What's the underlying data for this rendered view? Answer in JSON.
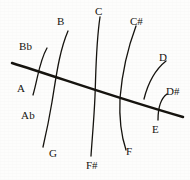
{
  "diagram": {
    "type": "hand-drawn-lattice",
    "background_color": "#fdfdfc",
    "ink_color": "#16140f",
    "axis": {
      "name": "main-diagonal-line",
      "start": [
        12,
        63
      ],
      "end": [
        183,
        117
      ],
      "stroke_width": 2.4
    },
    "arcs": [
      {
        "id": "arc-a-bb",
        "top_label": "Bb",
        "bottom_label": "Ab",
        "mid_label": "A",
        "path": "M 47 48 C 39 62, 38 78, 33 95",
        "stroke_width": 1.3
      },
      {
        "id": "arc-b-g",
        "top_label": "B",
        "bottom_label": "G",
        "path": "M 68 31 C 59 52, 56 78, 52 102 C 49 120, 46 134, 43 147",
        "stroke_width": 1.3
      },
      {
        "id": "arc-c-fsharp",
        "top_label": "C",
        "bottom_label": "F#",
        "path": "M 100 17 C 96 44, 96 70, 95 96 C 94 120, 92 140, 91 156",
        "stroke_width": 1.3
      },
      {
        "id": "arc-csharp-f",
        "top_label": "C#",
        "bottom_label": "F",
        "path": "M 136 26 C 127 50, 122 74, 120 98 C 119 120, 122 138, 126 150",
        "stroke_width": 1.3
      },
      {
        "id": "arc-d",
        "top_label": "D",
        "path": "M 166 61 C 156 69, 148 83, 144 99",
        "stroke_width": 1.3
      },
      {
        "id": "arc-dsharp-e",
        "top_label": "D#",
        "bottom_label": "E",
        "path": "M 167 94 C 160 99, 158 108, 158 120",
        "stroke_width": 1.3
      }
    ],
    "labels": [
      {
        "id": "label-bb",
        "text": "Bb",
        "x": 19,
        "y": 41,
        "kind": "flat"
      },
      {
        "id": "label-b",
        "text": "B",
        "x": 57,
        "y": 16,
        "kind": "natural"
      },
      {
        "id": "label-c",
        "text": "C",
        "x": 95,
        "y": 6,
        "kind": "natural"
      },
      {
        "id": "label-csharp",
        "text": "C#",
        "x": 130,
        "y": 16,
        "kind": "sharp"
      },
      {
        "id": "label-d",
        "text": "D",
        "x": 159,
        "y": 52,
        "kind": "natural"
      },
      {
        "id": "label-dsharp",
        "text": "D#",
        "x": 166,
        "y": 86,
        "kind": "sharp"
      },
      {
        "id": "label-a",
        "text": "A",
        "x": 17,
        "y": 83,
        "kind": "natural"
      },
      {
        "id": "label-ab",
        "text": "Ab",
        "x": 21,
        "y": 110,
        "kind": "flat"
      },
      {
        "id": "label-g",
        "text": "G",
        "x": 49,
        "y": 148,
        "kind": "natural"
      },
      {
        "id": "label-fsharp",
        "text": "F#",
        "x": 86,
        "y": 160,
        "kind": "sharp"
      },
      {
        "id": "label-f",
        "text": "F",
        "x": 126,
        "y": 146,
        "kind": "natural"
      },
      {
        "id": "label-e",
        "text": "E",
        "x": 152,
        "y": 124,
        "kind": "natural"
      }
    ]
  }
}
